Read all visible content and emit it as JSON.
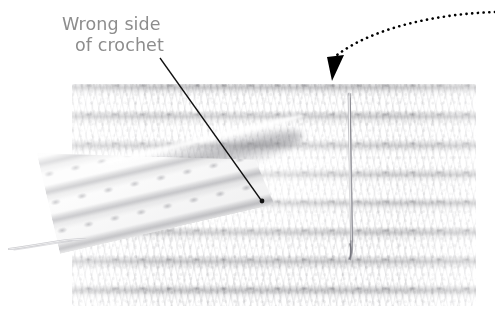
{
  "image": {
    "kind": "annotated-photograph",
    "subject": "crochet-swatch-wrong-side",
    "width": 495,
    "height": 329,
    "background_color": "#ffffff"
  },
  "annotations": {
    "label": {
      "line1": "Wrong side",
      "line2": "of crochet",
      "color": "#8d8d8d",
      "leader_line": {
        "color": "#111111",
        "from_x": 160,
        "from_y": 58,
        "to_x": 262,
        "to_y": 201,
        "endpoint_marker": "dot"
      }
    },
    "pointer_arrow": {
      "style": "dotted-curved-arrow",
      "color": "#000000",
      "dot_radius": 1.3,
      "dot_spacing": 5.6,
      "start_x": 495,
      "start_y": 12,
      "end_x": 333,
      "end_y": 58,
      "arrowhead_tip_x": 324,
      "arrowhead_tip_y": 80,
      "arrowhead_direction": "down-left"
    }
  },
  "photo": {
    "fabric": {
      "name": "crochet-swatch",
      "left": 72,
      "top": 84,
      "width": 404,
      "height": 222,
      "base_color": "#fbfbfb",
      "stitch_shadow_color": "#78787e",
      "row_height": 29,
      "stitch_width": 27,
      "rows_visible": 8
    },
    "folded_flap": {
      "name": "folded-corner",
      "left": 60,
      "top": 128,
      "width": 220,
      "height": 126,
      "rotation_deg": -13
    },
    "hook": {
      "name": "crochet-hook",
      "left": 345,
      "top": 92,
      "length": 170,
      "metal_color": "#9a9a9e",
      "highlight_color": "#f2f2f2"
    },
    "yarn_tail": {
      "name": "loose-yarn-tail",
      "left": 8,
      "top": 238,
      "length": 78,
      "color": "#c8c8cc"
    }
  }
}
